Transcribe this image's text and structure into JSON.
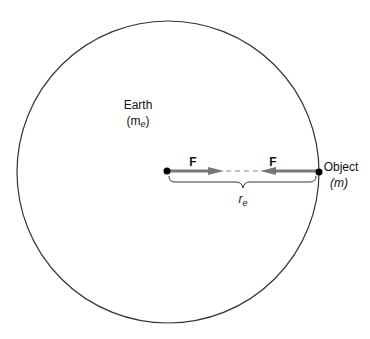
{
  "diagram": {
    "earth": {
      "label": "Earth",
      "mass_label_base": "(m",
      "mass_label_sub": "e",
      "mass_label_close": ")"
    },
    "object": {
      "label": "Object",
      "mass_label": "(m)"
    },
    "forces": {
      "left_label": "F",
      "right_label": "F"
    },
    "distance": {
      "label_base": "r",
      "label_sub": "e"
    },
    "colors": {
      "circle": "#333333",
      "arrow": "#777777",
      "dot": "#000000"
    }
  }
}
